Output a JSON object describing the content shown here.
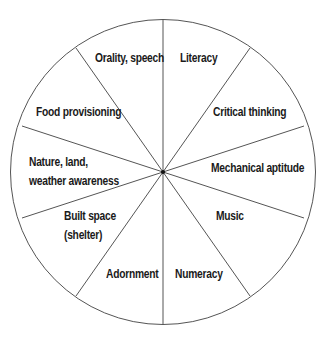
{
  "diagram": {
    "type": "segmented-wheel",
    "segment_count": 10,
    "colors": {
      "line": "#555555",
      "text": "#1a1a1a",
      "background": "#ffffff",
      "center_dot": "#111111"
    },
    "segments": [
      {
        "label": "Orality, speech"
      },
      {
        "label": "Literacy"
      },
      {
        "label": "Critical thinking"
      },
      {
        "label": "Mechanical aptitude"
      },
      {
        "label": "Music"
      },
      {
        "label": "Numeracy"
      },
      {
        "label": "Adornment"
      },
      {
        "label": "Built space",
        "label2": "(shelter)"
      },
      {
        "label": "Nature, land,",
        "label2": "weather awareness"
      },
      {
        "label": "Food provisioning"
      }
    ]
  }
}
